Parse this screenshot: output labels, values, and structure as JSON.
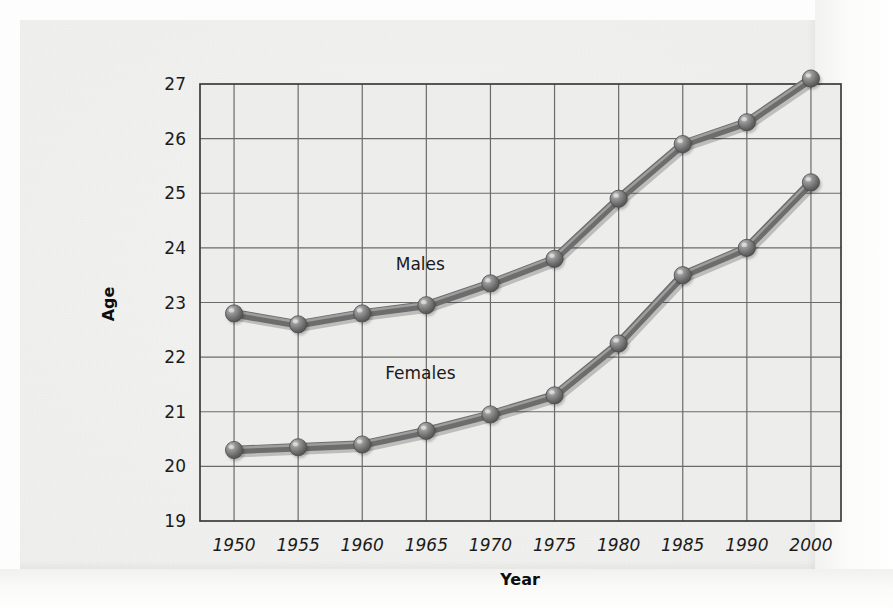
{
  "chart_data": {
    "type": "line",
    "title": "",
    "xlabel": "Year",
    "ylabel": "Age",
    "categories": [
      "1950",
      "1955",
      "1960",
      "1965",
      "1970",
      "1975",
      "1980",
      "1985",
      "1990",
      "2000"
    ],
    "x_tick_labels": [
      "1950",
      "1955",
      "1960",
      "1965",
      "1970",
      "1975",
      "1980",
      "1985",
      "1990",
      "2000"
    ],
    "y_tick_labels": [
      "19",
      "20",
      "21",
      "22",
      "23",
      "24",
      "25",
      "26",
      "27"
    ],
    "ylim": [
      19,
      27
    ],
    "xlim": [
      0,
      9
    ],
    "grid": true,
    "legend_position": "inline-annotations",
    "series": [
      {
        "name": "Males",
        "label": "Males",
        "color": "#6f6f6f",
        "values": [
          22.8,
          22.6,
          22.8,
          22.95,
          23.35,
          23.8,
          24.9,
          25.9,
          26.3,
          27.1
        ]
      },
      {
        "name": "Females",
        "label": "Females",
        "color": "#6f6f6f",
        "values": [
          20.3,
          20.35,
          20.4,
          20.65,
          20.95,
          21.3,
          22.25,
          23.5,
          24.0,
          25.2
        ]
      }
    ],
    "annotations": [
      {
        "text": "Males",
        "near_x": "1965",
        "near_y": 23.6
      },
      {
        "text": "Females",
        "near_x": "1965",
        "near_y": 21.6
      }
    ]
  },
  "style": {
    "page_background": "#efefed",
    "plot_background": "#ececeb",
    "grid_color": "#6b6b6b",
    "axis_color": "#3b3b3b",
    "line_color": "#7a7a7a",
    "marker_color": "#777777",
    "text_color": "#1b1b1b"
  }
}
